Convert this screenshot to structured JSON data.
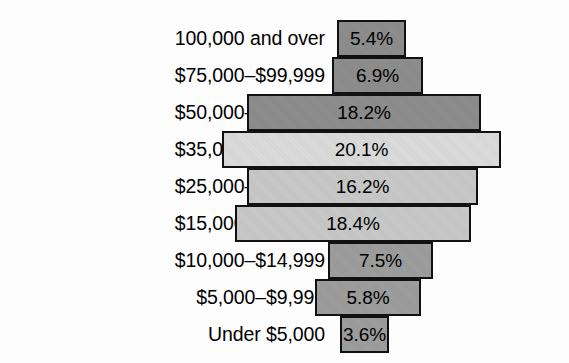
{
  "chart_data": {
    "type": "bar",
    "title": "",
    "subtitle": "",
    "xlabel": "",
    "ylabel": "",
    "orientation": "horizontal",
    "value_suffix": "%",
    "grid": false,
    "legend": false,
    "axis_visible": false,
    "xlim": [
      0,
      20.1
    ],
    "categories": [
      "100,000 and over",
      "$75,000–$99,999",
      "$50,000–$74,999",
      "$35,000–$49,999",
      "$25,000–$34,999",
      "$15,000–$24,999",
      "$10,000–$14,999",
      "$5,000–$9,999",
      "Under $5,000"
    ],
    "values": [
      5.4,
      6.9,
      18.2,
      20.1,
      16.2,
      18.4,
      7.5,
      5.8,
      3.6
    ],
    "value_labels": [
      "5.4%",
      "6.9%",
      "18.2%",
      "20.1%",
      "16.2%",
      "18.4%",
      "7.5%",
      "5.8%",
      "3.6%"
    ],
    "bar_colors": [
      "#8e8e8e",
      "#8e8e8e",
      "#8e8e8e",
      "#dcdcdc",
      "#c9c9c9",
      "#c9c9c9",
      "#9e9e9e",
      "#9e9e9e",
      "#9e9e9e"
    ],
    "bar_border_color": "#111111",
    "background_color": "#fdfdfd",
    "rows": [
      {
        "label": "100,000 and over",
        "value": 5.4,
        "value_label": "5.4%",
        "color": "#8e8e8e",
        "left": 337,
        "width": 69,
        "top": 20
      },
      {
        "label": "$75,000–$99,999",
        "value": 6.9,
        "value_label": "6.9%",
        "color": "#8e8e8e",
        "left": 332,
        "width": 91,
        "top": 57
      },
      {
        "label": "$50,000–$74,999",
        "value": 18.2,
        "value_label": "18.2%",
        "color": "#8e8e8e",
        "left": 247,
        "width": 234,
        "top": 94
      },
      {
        "label": "$35,000–$49,999",
        "value": 20.1,
        "value_label": "20.1%",
        "color": "#dcdcdc",
        "left": 222,
        "width": 279,
        "top": 131
      },
      {
        "label": "$25,000–$34,999",
        "value": 16.2,
        "value_label": "16.2%",
        "color": "#c9c9c9",
        "left": 247,
        "width": 231,
        "top": 168
      },
      {
        "label": "$15,000–$24,999",
        "value": 18.4,
        "value_label": "18.4%",
        "color": "#c9c9c9",
        "left": 235,
        "width": 236,
        "top": 205
      },
      {
        "label": "$10,000–$14,999",
        "value": 7.5,
        "value_label": "7.5%",
        "color": "#9e9e9e",
        "left": 328,
        "width": 105,
        "top": 242
      },
      {
        "label": "$5,000–$9,999",
        "value": 5.8,
        "value_label": "5.8%",
        "color": "#9e9e9e",
        "left": 315,
        "width": 106,
        "top": 279
      },
      {
        "label": "Under $5,000",
        "value": 3.6,
        "value_label": "3.6%",
        "color": "#9e9e9e",
        "left": 340,
        "width": 49,
        "top": 316
      }
    ]
  }
}
